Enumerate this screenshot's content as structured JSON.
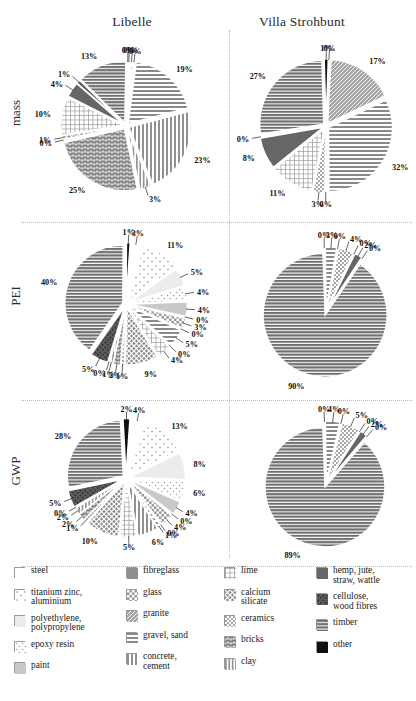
{
  "figure": {
    "columns": [
      {
        "key": "libelle",
        "title": "Libelle"
      },
      {
        "key": "villa",
        "title": "Villa Strohbunt"
      }
    ],
    "rows": [
      {
        "key": "mass",
        "label": "mass"
      },
      {
        "key": "pei",
        "label": "PEI"
      },
      {
        "key": "gwp",
        "label": "GWP"
      }
    ]
  },
  "materials": [
    {
      "id": "steel",
      "label": "steel",
      "label2": "",
      "pattern": "blank",
      "color": "#fdfdfd"
    },
    {
      "id": "titanium-zinc",
      "label": "titanium zinc,",
      "label2": "aluminium",
      "pattern": "sparse-dots",
      "color": "#f2f2f2"
    },
    {
      "id": "polyethylene",
      "label": "polyethylene,",
      "label2": "polypropylene",
      "pattern": "solid",
      "color": "#ececec"
    },
    {
      "id": "epoxy-resin",
      "label": "epoxy resin",
      "label2": "",
      "pattern": "dots",
      "color": "#f5f5f5"
    },
    {
      "id": "paint",
      "label": "paint",
      "label2": "",
      "pattern": "solid",
      "color": "#c9c9c9"
    },
    {
      "id": "fibreglass",
      "label": "fibreglass",
      "label2": "",
      "pattern": "solid",
      "color": "#8f8f8f"
    },
    {
      "id": "glass",
      "label": "glass",
      "label2": "",
      "pattern": "checker",
      "color": "#9a9a9a"
    },
    {
      "id": "granite",
      "label": "granite",
      "label2": "",
      "pattern": "fine-hatch",
      "color": "#a5a5a5"
    },
    {
      "id": "gravel-sand",
      "label": "gravel, sand",
      "label2": "",
      "pattern": "hlines",
      "color": "#8a8a8a"
    },
    {
      "id": "concrete-cement",
      "label": "concrete,",
      "label2": "cement",
      "pattern": "vlines",
      "color": "#909090"
    },
    {
      "id": "lime",
      "label": "lime",
      "label2": "",
      "pattern": "grid",
      "color": "#9e9e9e"
    },
    {
      "id": "calcium-silicate",
      "label": "calcium",
      "label2": "silicate",
      "pattern": "crosshatch",
      "color": "#8c8c8c"
    },
    {
      "id": "ceramics",
      "label": "ceramics",
      "label2": "",
      "pattern": "stipple",
      "color": "#9b9b9b"
    },
    {
      "id": "bricks",
      "label": "bricks",
      "label2": "",
      "pattern": "brick",
      "color": "#7f7f7f"
    },
    {
      "id": "clay",
      "label": "clay",
      "label2": "",
      "pattern": "vhatch",
      "color": "#949494"
    },
    {
      "id": "hemp-jute",
      "label": "hemp, jute,",
      "label2": "straw, wattle",
      "pattern": "solid",
      "color": "#666666"
    },
    {
      "id": "cellulose",
      "label": "cellulose,",
      "label2": "wood fibres",
      "pattern": "coarse-dots",
      "color": "#5c5c5c"
    },
    {
      "id": "timber",
      "label": "timber",
      "label2": "",
      "pattern": "hlines-bold",
      "color": "#6f6f6f"
    },
    {
      "id": "other",
      "label": "other",
      "label2": "",
      "pattern": "solid",
      "color": "#101010"
    }
  ],
  "chart_data": [
    {
      "id": "mass-libelle",
      "type": "pie",
      "title": "Libelle",
      "row": "mass",
      "labels": [
        "steel",
        "titanium zinc, aluminium",
        "polyethylene, polypropylene",
        "epoxy resin",
        "paint",
        "fibreglass",
        "glass",
        "granite",
        "gravel, sand",
        "concrete, cement",
        "lime",
        "calcium silicate",
        "ceramics",
        "bricks",
        "clay",
        "hemp, jute, straw, wattle",
        "cellulose, wood fibres",
        "timber",
        "other"
      ],
      "slice_labels": [
        "0%",
        "1%",
        "0%",
        "19%",
        "23%",
        "3%",
        "25%",
        "0%",
        "1%",
        "10%",
        "4%",
        "1%",
        "13%",
        "0%"
      ],
      "values": [
        0,
        1,
        0,
        19,
        23,
        3,
        25,
        0,
        1,
        10,
        4,
        1,
        13,
        0
      ],
      "material_ids": [
        "steel",
        "titanium-zinc",
        "polyethylene",
        "gravel-sand",
        "concrete-cement",
        "clay",
        "bricks",
        "ceramics",
        "calcium-silicate",
        "lime",
        "hemp-jute",
        "cellulose",
        "timber",
        "other"
      ]
    },
    {
      "id": "mass-villa",
      "type": "pie",
      "title": "Villa Strohbunt",
      "row": "mass",
      "slice_labels": [
        "0%",
        "17%",
        "32%",
        "0%",
        "3%",
        "11%",
        "8%",
        "0%",
        "27%",
        "1%"
      ],
      "values": [
        0,
        17,
        32,
        0,
        3,
        11,
        8,
        0,
        27,
        1
      ],
      "material_ids": [
        "steel",
        "granite",
        "gravel-sand",
        "clay",
        "ceramics",
        "lime",
        "hemp-jute",
        "cellulose",
        "timber",
        "other"
      ]
    },
    {
      "id": "pei-libelle",
      "type": "pie",
      "title": "Libelle",
      "row": "PEI",
      "slice_labels": [
        "3%",
        "11%",
        "5%",
        "4%",
        "4%",
        "0%",
        "3%",
        "0%",
        "5%",
        "0%",
        "4%",
        "9%",
        "1%",
        "2%",
        "1%",
        "0%",
        "5%",
        "40%",
        "1%"
      ],
      "values": [
        3,
        11,
        5,
        4,
        4,
        0,
        3,
        0,
        5,
        0,
        4,
        9,
        1,
        2,
        1,
        0,
        5,
        40,
        1
      ],
      "material_ids": [
        "steel",
        "titanium-zinc",
        "polyethylene",
        "epoxy-resin",
        "paint",
        "fibreglass",
        "glass",
        "granite",
        "gravel-sand",
        "concrete-cement",
        "lime",
        "calcium-silicate",
        "ceramics",
        "bricks",
        "clay",
        "hemp-jute",
        "cellulose",
        "timber",
        "other"
      ]
    },
    {
      "id": "pei-villa",
      "type": "pie",
      "title": "Villa Strohbunt",
      "row": "PEI",
      "slice_labels": [
        "0%",
        "3%",
        "0%",
        "4%",
        "0%",
        "2%",
        "0%",
        "90%"
      ],
      "values": [
        0,
        3,
        0,
        4,
        0,
        2,
        0,
        90
      ],
      "material_ids": [
        "steel",
        "gravel-sand",
        "lime",
        "ceramics",
        "bricks",
        "hemp-jute",
        "cellulose",
        "timber"
      ]
    },
    {
      "id": "gwp-libelle",
      "type": "pie",
      "title": "Libelle",
      "row": "GWP",
      "slice_labels": [
        "4%",
        "13%",
        "8%",
        "6%",
        "4%",
        "0%",
        "4%",
        "0%",
        "1%",
        "6%",
        "5%",
        "10%",
        "1%",
        "2%",
        "2%",
        "0%",
        "5%",
        "28%",
        "2%"
      ],
      "values": [
        4,
        13,
        8,
        6,
        4,
        0,
        4,
        0,
        1,
        6,
        5,
        10,
        1,
        2,
        2,
        0,
        5,
        28,
        2
      ],
      "material_ids": [
        "steel",
        "titanium-zinc",
        "polyethylene",
        "epoxy-resin",
        "paint",
        "fibreglass",
        "glass",
        "granite",
        "gravel-sand",
        "concrete-cement",
        "lime",
        "calcium-silicate",
        "ceramics",
        "bricks",
        "clay",
        "hemp-jute",
        "cellulose",
        "timber",
        "other"
      ]
    },
    {
      "id": "gwp-villa",
      "type": "pie",
      "title": "Villa Strohbunt",
      "row": "GWP",
      "slice_labels": [
        "0%",
        "4%",
        "0%",
        "5%",
        "0%",
        "2%",
        "0%",
        "89%"
      ],
      "values": [
        0,
        4,
        0,
        5,
        0,
        2,
        0,
        89
      ],
      "material_ids": [
        "steel",
        "gravel-sand",
        "lime",
        "ceramics",
        "bricks",
        "hemp-jute",
        "cellulose",
        "timber"
      ]
    }
  ]
}
